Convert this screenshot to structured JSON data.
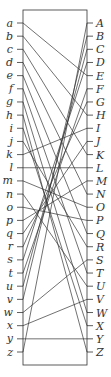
{
  "diagram": {
    "type": "bipartite-matching",
    "left_labels": [
      "a",
      "b",
      "c",
      "d",
      "e",
      "f",
      "g",
      "h",
      "i",
      "j",
      "k",
      "l",
      "m",
      "n",
      "o",
      "p",
      "q",
      "r",
      "s",
      "t",
      "u",
      "v",
      "w",
      "x",
      "y",
      "z"
    ],
    "right_labels": [
      "A",
      "B",
      "C",
      "D",
      "E",
      "F",
      "G",
      "H",
      "I",
      "J",
      "K",
      "L",
      "M",
      "N",
      "O",
      "P",
      "Q",
      "R",
      "S",
      "T",
      "U",
      "V",
      "W",
      "X",
      "Y",
      "Z"
    ],
    "connections": [
      [
        "a",
        "E"
      ],
      [
        "b",
        "H"
      ],
      [
        "c",
        "K"
      ],
      [
        "d",
        "N"
      ],
      [
        "e",
        "Q"
      ],
      [
        "f",
        "T"
      ],
      [
        "g",
        "W"
      ],
      [
        "h",
        "Z"
      ],
      [
        "i",
        "X"
      ],
      [
        "j",
        "R"
      ],
      [
        "k",
        "I"
      ],
      [
        "l",
        "L"
      ],
      [
        "m",
        "O"
      ],
      [
        "n",
        "U"
      ],
      [
        "o",
        "P"
      ],
      [
        "p",
        "M"
      ],
      [
        "q",
        "J"
      ],
      [
        "r",
        "G"
      ],
      [
        "s",
        "D"
      ],
      [
        "t",
        "F"
      ],
      [
        "u",
        "C"
      ],
      [
        "v",
        "B"
      ],
      [
        "w",
        "S"
      ],
      [
        "x",
        "V"
      ],
      [
        "y",
        "Y"
      ],
      [
        "z",
        "A"
      ]
    ]
  }
}
